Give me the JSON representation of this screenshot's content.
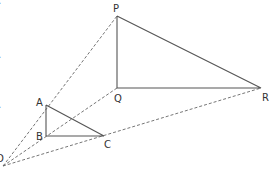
{
  "diagram": {
    "type": "enlargement / similar triangles",
    "center": {
      "label": "O",
      "x": 3,
      "y": 166
    },
    "small_triangle": {
      "vertices": [
        {
          "label": "A",
          "x": 46,
          "y": 105
        },
        {
          "label": "B",
          "x": 46,
          "y": 136
        },
        {
          "label": "C",
          "x": 104,
          "y": 136
        }
      ]
    },
    "large_triangle": {
      "vertices": [
        {
          "label": "P",
          "x": 117,
          "y": 16
        },
        {
          "label": "Q",
          "x": 117,
          "y": 88
        },
        {
          "label": "R",
          "x": 261,
          "y": 88
        }
      ]
    },
    "rays": [
      "O-P",
      "O-Q",
      "O-R"
    ],
    "extra_segment": "B-Q (dashed through triangle)",
    "labels": {
      "P": "P",
      "Q": "Q",
      "R": "R",
      "A": "A",
      "B": "B",
      "C": "C",
      "O": "O"
    },
    "edge_fragments": [
      ".",
      ".",
      "."
    ]
  }
}
